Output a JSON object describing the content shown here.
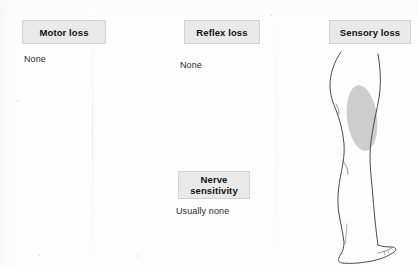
{
  "diagram": {
    "background_color": "#fdfdfd",
    "box_fill_color": "#e9e9e9",
    "box_border_color": "#d2d2d2",
    "text_color": "#1c1c1c",
    "patch_color": "#c9c9c9",
    "outline_color": "#4a4a4a"
  },
  "panels": [
    {
      "id": "motor-loss",
      "label": "Motor loss",
      "value": "None"
    },
    {
      "id": "reflex-loss",
      "label": "Reflex loss",
      "value": "None"
    },
    {
      "id": "nerve-sensitivity",
      "label_line1": "Nerve",
      "label_line2": "sensitivity",
      "label": "Nerve sensitivity",
      "value": "Usually none"
    },
    {
      "id": "sensory-loss",
      "label": "Sensory loss",
      "value": ""
    }
  ],
  "figure": {
    "name": "leg-lateral-view",
    "shaded_region": "lateral thigh"
  }
}
